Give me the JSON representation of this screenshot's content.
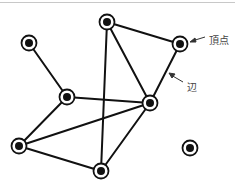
{
  "diagram": {
    "type": "graph",
    "nodes": [
      {
        "id": "top",
        "x": 107,
        "y": 22
      },
      {
        "id": "topright",
        "x": 180,
        "y": 44
      },
      {
        "id": "left",
        "x": 29,
        "y": 43
      },
      {
        "id": "midleft",
        "x": 67,
        "y": 97
      },
      {
        "id": "midright",
        "x": 150,
        "y": 103
      },
      {
        "id": "bottomleft",
        "x": 19,
        "y": 146
      },
      {
        "id": "bottom",
        "x": 101,
        "y": 171
      },
      {
        "id": "isolated",
        "x": 190,
        "y": 148
      }
    ],
    "edges": [
      [
        "left",
        "midleft"
      ],
      [
        "top",
        "topright"
      ],
      [
        "top",
        "midright"
      ],
      [
        "top",
        "bottom"
      ],
      [
        "topright",
        "midright"
      ],
      [
        "midleft",
        "midright"
      ],
      [
        "midleft",
        "bottomleft"
      ],
      [
        "bottomleft",
        "midright"
      ],
      [
        "bottomleft",
        "bottom"
      ],
      [
        "bottom",
        "midright"
      ]
    ],
    "annotations": {
      "vertex_label": "頂点",
      "edge_label": "辺"
    }
  }
}
